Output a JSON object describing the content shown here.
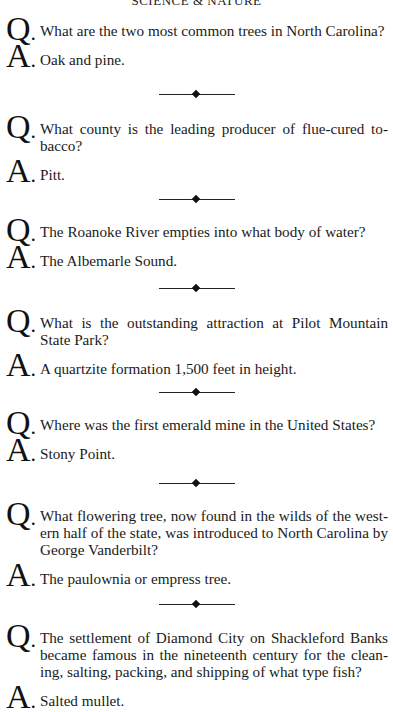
{
  "page": {
    "header": "Science & Nature",
    "question_marker": "Q",
    "answer_marker": "A",
    "marker_punct": "."
  },
  "items": [
    {
      "question": "What are the two most common trees in North Carolina?",
      "answer": "Oak and pine."
    },
    {
      "question": "What county is the leading producer of flue-cured to-bacco?",
      "answer": "Pitt."
    },
    {
      "question": "The Roanoke River empties into what body of water?",
      "answer": "The Albemarle Sound."
    },
    {
      "question": "What is the outstanding attraction at Pilot Mountain State Park?",
      "answer": "A quartzite formation 1,500 feet in height."
    },
    {
      "question": "Where was the first emerald mine in the United States?",
      "answer": "Stony Point."
    },
    {
      "question": "What flowering tree, now found in the wilds of the west-ern half of the state, was introduced to North Carolina by George Vanderbilt?",
      "answer": "The paulownia or empress tree."
    },
    {
      "question": "The settlement of Diamond City on Shackleford Banks became famous in the nineteenth century for the clean-ing, salting, packing, and shipping of what type fish?",
      "answer": "Salted mullet."
    }
  ]
}
